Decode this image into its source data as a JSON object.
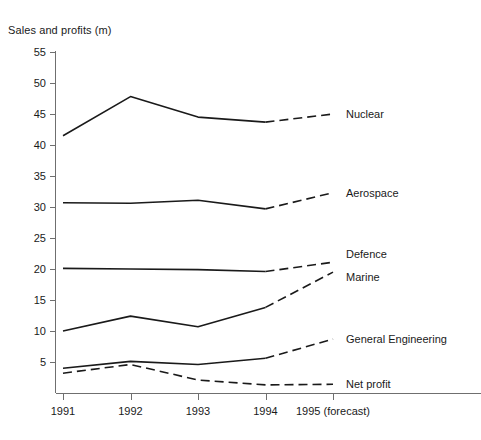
{
  "chart_data": {
    "type": "line",
    "title": "Sales and profits (m)",
    "xlabel": "",
    "ylabel": "",
    "x": [
      "1991",
      "1992",
      "1993",
      "1994",
      "1995 (forecast)"
    ],
    "categories": [
      "1991",
      "1992",
      "1993",
      "1994",
      "1995 (forecast)"
    ],
    "xtick_labels": [
      "1991",
      "1992",
      "1993",
      "1994",
      "1995 (forecast)"
    ],
    "ytick_labels": [
      "5",
      "10",
      "15",
      "20",
      "25",
      "30",
      "35",
      "40",
      "45",
      "50",
      "55"
    ],
    "yticks": [
      5,
      10,
      15,
      20,
      25,
      30,
      35,
      40,
      45,
      50,
      55
    ],
    "ylim": [
      0,
      55
    ],
    "grid": false,
    "legend": "right-inline-labels",
    "forecast_note": "Final segment (1994 to 1995) drawn dashed for all series; Net profit dashed throughout",
    "series": [
      {
        "name": "Nuclear",
        "label": "Nuclear",
        "values": [
          41.5,
          47.8,
          44.5,
          43.7,
          45.0
        ],
        "style": "solid-with-dashed-forecast",
        "label_value": 45.0
      },
      {
        "name": "Aerospace",
        "label": "Aerospace",
        "values": [
          30.7,
          30.6,
          31.1,
          29.7,
          32.3
        ],
        "style": "solid-with-dashed-forecast",
        "label_value": 32.3
      },
      {
        "name": "Defence",
        "label": "Defence",
        "values": [
          20.1,
          20.0,
          19.9,
          19.6,
          21.1
        ],
        "style": "solid-with-dashed-forecast",
        "label_value": 21.1
      },
      {
        "name": "Marine",
        "label": "Marine",
        "values": [
          10.0,
          12.4,
          10.7,
          13.8,
          19.5
        ],
        "style": "solid-with-dashed-forecast",
        "label_value": 19.5
      },
      {
        "name": "General Engineering",
        "label": "General Engineering",
        "values": [
          4.0,
          5.1,
          4.6,
          5.6,
          8.7
        ],
        "style": "solid-with-dashed-forecast",
        "label_value": 8.7
      },
      {
        "name": "Net profit",
        "label": "Net profit",
        "values": [
          3.2,
          4.6,
          2.1,
          1.3,
          1.4
        ],
        "style": "dashed",
        "label_value": 1.4
      }
    ],
    "colors": {
      "line": "#1a1a1a",
      "axis": "#6f6f6f",
      "text": "#1a1a1a",
      "background": "#ffffff"
    }
  }
}
